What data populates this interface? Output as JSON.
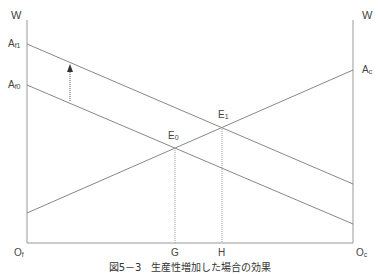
{
  "diagram": {
    "type": "two-sector labor market (specific factors)",
    "axes": {
      "left_top": "W",
      "right_top": "W",
      "left_origin": "O",
      "left_origin_sub": "f",
      "right_origin": "O",
      "right_origin_sub": "c"
    },
    "labels": {
      "af1": "A",
      "af1_sub": "f1",
      "af0": "A",
      "af0_sub": "f0",
      "ac": "A",
      "ac_sub": "c",
      "e0": "E",
      "e0_sub": "0",
      "e1": "E",
      "e1_sub": "1",
      "g": "G",
      "h": "H"
    },
    "caption": "図5－3　生産性増加した場合の効果",
    "colors": {
      "line": "#888888",
      "text": "#444444"
    }
  }
}
